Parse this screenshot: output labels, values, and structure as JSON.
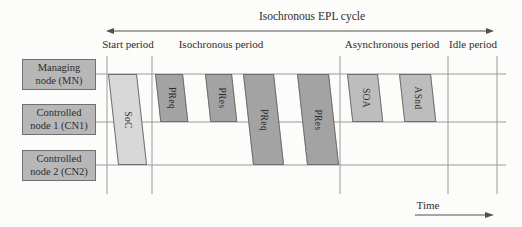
{
  "title": "Isochronous EPL cycle",
  "time_axis_label": "Time",
  "periods": [
    {
      "label": "Start period"
    },
    {
      "label": "Isochronous period"
    },
    {
      "label": "Asynchronous period"
    },
    {
      "label": "Idle period"
    }
  ],
  "nodes": [
    {
      "line1": "Managing",
      "line2": "node (MN)"
    },
    {
      "line1": "Controlled",
      "line2": "node 1 (CN1)"
    },
    {
      "line1": "Controlled",
      "line2": "node 2 (CN2)"
    }
  ],
  "messages": [
    {
      "label": "SoC",
      "spans_nodes": "MN to CN2 line",
      "period": "Start period"
    },
    {
      "label": "PReq",
      "spans_nodes": "MN to CN1 line",
      "period": "Isochronous period"
    },
    {
      "label": "PRes",
      "spans_nodes": "MN to CN1 line",
      "period": "Isochronous period"
    },
    {
      "label": "PReq",
      "spans_nodes": "MN to CN2 line",
      "period": "Isochronous period"
    },
    {
      "label": "PRes",
      "spans_nodes": "MN to CN2 line",
      "period": "Isochronous period"
    },
    {
      "label": "SOA",
      "spans_nodes": "MN to CN1 line",
      "period": "Asynchronous period"
    },
    {
      "label": "ASnd",
      "spans_nodes": "MN to CN1 line",
      "period": "Asynchronous period"
    }
  ],
  "colors": {
    "background": "#fcfcfa",
    "node_box_fill": "#b7b7b7",
    "node_box_border": "#707070",
    "soc_fill": "#d8d8d8",
    "isochronous_msg_fill": "#a3a3a3",
    "asynchronous_msg_fill": "#bdbdbd",
    "msg_border": "#6f6f6f",
    "grid_line": "#9a9a9a",
    "arrow": "#4f4f4f",
    "text": "#2e2e2e"
  }
}
